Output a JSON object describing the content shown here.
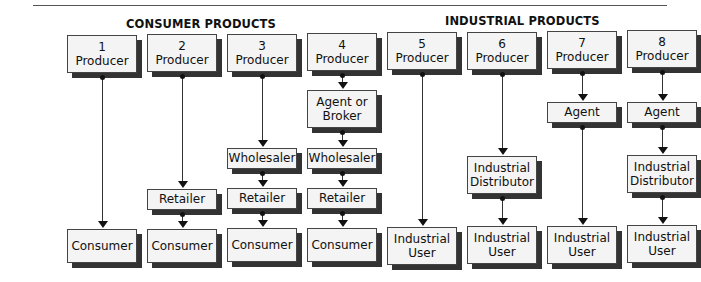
{
  "sections": {
    "consumer": "CONSUMER PRODUCTS",
    "industrial": "INDUSTRIAL PRODUCTS"
  },
  "channels": [
    {
      "id": "1",
      "x": 67,
      "nodes": [
        {
          "lines": [
            "1",
            "Producer"
          ],
          "top": 35,
          "h": 38,
          "w": 70
        },
        {
          "lines": [
            "Consumer"
          ],
          "top": 229,
          "h": 34,
          "w": 70
        }
      ]
    },
    {
      "id": "2",
      "x": 147,
      "nodes": [
        {
          "lines": [
            "2",
            "Producer"
          ],
          "top": 34,
          "h": 38,
          "w": 70
        },
        {
          "lines": [
            "Retailer"
          ],
          "top": 189,
          "h": 21,
          "w": 70
        },
        {
          "lines": [
            "Consumer"
          ],
          "top": 229,
          "h": 34,
          "w": 70
        }
      ]
    },
    {
      "id": "3",
      "x": 227,
      "nodes": [
        {
          "lines": [
            "3",
            "Producer"
          ],
          "top": 34,
          "h": 38,
          "w": 70
        },
        {
          "lines": [
            "Wholesaler"
          ],
          "top": 148,
          "h": 21,
          "w": 70
        },
        {
          "lines": [
            "Retailer"
          ],
          "top": 188,
          "h": 21,
          "w": 70
        },
        {
          "lines": [
            "Consumer"
          ],
          "top": 228,
          "h": 34,
          "w": 70
        }
      ]
    },
    {
      "id": "4",
      "x": 307,
      "nodes": [
        {
          "lines": [
            "4",
            "Producer"
          ],
          "top": 33,
          "h": 38,
          "w": 70
        },
        {
          "lines": [
            "Agent or",
            "Broker"
          ],
          "top": 90,
          "h": 38,
          "w": 70
        },
        {
          "lines": [
            "Wholesaler"
          ],
          "top": 148,
          "h": 21,
          "w": 70
        },
        {
          "lines": [
            "Retailer"
          ],
          "top": 188,
          "h": 21,
          "w": 70
        },
        {
          "lines": [
            "Consumer"
          ],
          "top": 228,
          "h": 34,
          "w": 70
        }
      ]
    },
    {
      "id": "5",
      "x": 387,
      "nodes": [
        {
          "lines": [
            "5",
            "Producer"
          ],
          "top": 32,
          "h": 38,
          "w": 70
        },
        {
          "lines": [
            "Industrial",
            "User"
          ],
          "top": 227,
          "h": 38,
          "w": 70
        }
      ]
    },
    {
      "id": "6",
      "x": 467,
      "nodes": [
        {
          "lines": [
            "6",
            "Producer"
          ],
          "top": 32,
          "h": 38,
          "w": 70
        },
        {
          "lines": [
            "Industrial",
            "Distributor"
          ],
          "top": 156,
          "h": 38,
          "w": 70
        },
        {
          "lines": [
            "Industrial",
            "User"
          ],
          "top": 226,
          "h": 38,
          "w": 70
        }
      ]
    },
    {
      "id": "7",
      "x": 547,
      "nodes": [
        {
          "lines": [
            "7",
            "Producer"
          ],
          "top": 31,
          "h": 38,
          "w": 70
        },
        {
          "lines": [
            "Agent"
          ],
          "top": 102,
          "h": 21,
          "w": 70
        },
        {
          "lines": [
            "Industrial",
            "User"
          ],
          "top": 226,
          "h": 38,
          "w": 70
        }
      ]
    },
    {
      "id": "8",
      "x": 627,
      "nodes": [
        {
          "lines": [
            "8",
            "Producer"
          ],
          "top": 30,
          "h": 38,
          "w": 70
        },
        {
          "lines": [
            "Agent"
          ],
          "top": 102,
          "h": 21,
          "w": 70
        },
        {
          "lines": [
            "Industrial",
            "Distributor"
          ],
          "top": 155,
          "h": 38,
          "w": 70
        },
        {
          "lines": [
            "Industrial",
            "User"
          ],
          "top": 225,
          "h": 38,
          "w": 70
        }
      ]
    }
  ]
}
